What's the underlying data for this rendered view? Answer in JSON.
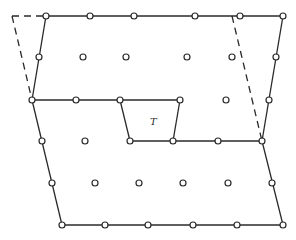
{
  "diagram": {
    "type": "lattice-supercell",
    "label_T": "T",
    "colors": {
      "line": "#2a2a2a",
      "node_fill": "#ffffff",
      "background": "#ffffff"
    },
    "solid_edges": [
      {
        "from": [
          46,
          16
        ],
        "to": [
          283,
          16
        ]
      },
      {
        "from": [
          46,
          16
        ],
        "to": [
          32,
          100
        ]
      },
      {
        "from": [
          283,
          16
        ],
        "to": [
          262,
          141
        ]
      },
      {
        "from": [
          32,
          100
        ],
        "to": [
          180,
          100
        ]
      },
      {
        "from": [
          120,
          100
        ],
        "to": [
          130,
          141
        ]
      },
      {
        "from": [
          180,
          100
        ],
        "to": [
          173,
          141
        ]
      },
      {
        "from": [
          130,
          141
        ],
        "to": [
          262,
          141
        ]
      },
      {
        "from": [
          32,
          100
        ],
        "to": [
          62,
          225
        ]
      },
      {
        "from": [
          262,
          141
        ],
        "to": [
          283,
          225
        ]
      },
      {
        "from": [
          62,
          225
        ],
        "to": [
          283,
          225
        ]
      }
    ],
    "dashed_edges": [
      {
        "from": [
          12,
          16
        ],
        "to": [
          46,
          16
        ]
      },
      {
        "from": [
          12,
          16
        ],
        "to": [
          32,
          100
        ]
      },
      {
        "from": [
          232,
          16
        ],
        "to": [
          262,
          141
        ]
      }
    ],
    "nodes": [
      [
        46,
        16
      ],
      [
        90,
        16
      ],
      [
        134,
        16
      ],
      [
        195,
        16
      ],
      [
        240,
        16
      ],
      [
        283,
        16
      ],
      [
        39,
        57
      ],
      [
        83,
        57
      ],
      [
        126,
        57
      ],
      [
        187,
        57
      ],
      [
        232,
        57
      ],
      [
        276,
        57
      ],
      [
        32,
        100
      ],
      [
        76,
        100
      ],
      [
        120,
        100
      ],
      [
        180,
        100
      ],
      [
        226,
        100
      ],
      [
        269,
        100
      ],
      [
        42,
        141
      ],
      [
        85,
        141
      ],
      [
        130,
        141
      ],
      [
        173,
        141
      ],
      [
        218,
        141
      ],
      [
        262,
        141
      ],
      [
        52,
        183
      ],
      [
        95,
        183
      ],
      [
        139,
        183
      ],
      [
        183,
        183
      ],
      [
        228,
        183
      ],
      [
        272,
        183
      ],
      [
        62,
        225
      ],
      [
        105,
        225
      ],
      [
        148,
        225
      ],
      [
        193,
        225
      ],
      [
        237,
        225
      ],
      [
        283,
        225
      ]
    ],
    "label_position": [
      150,
      125
    ]
  }
}
